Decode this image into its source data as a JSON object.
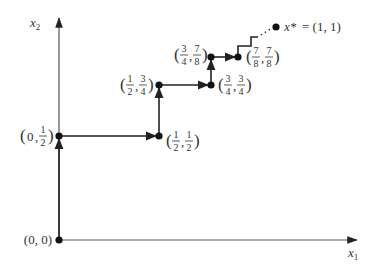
{
  "figure": {
    "axes": {
      "x_label": "x",
      "x_label_sub": "1",
      "y_label": "x",
      "y_label_sub": "2"
    },
    "points": [
      {
        "id": "p0",
        "label_plain": "(0, 0)",
        "x": 0,
        "y": 0
      },
      {
        "id": "p1",
        "label_plain": "(0, 1/2)",
        "x_num": "0",
        "y_num": "1",
        "y_den": "2",
        "x": 0,
        "y": 0.5
      },
      {
        "id": "p2",
        "label_plain": "(1/2, 1/2)",
        "x_num": "1",
        "x_den": "2",
        "y_num": "1",
        "y_den": "2",
        "x": 0.5,
        "y": 0.5
      },
      {
        "id": "p3",
        "label_plain": "(1/2, 3/4)",
        "x_num": "1",
        "x_den": "2",
        "y_num": "3",
        "y_den": "4",
        "x": 0.5,
        "y": 0.75
      },
      {
        "id": "p4",
        "label_plain": "(3/4, 3/4)",
        "x_num": "3",
        "x_den": "4",
        "y_num": "3",
        "y_den": "4",
        "x": 0.75,
        "y": 0.75
      },
      {
        "id": "p5",
        "label_plain": "(3/4, 7/8)",
        "x_num": "3",
        "x_den": "4",
        "y_num": "7",
        "y_den": "8",
        "x": 0.75,
        "y": 0.875
      },
      {
        "id": "p6",
        "label_plain": "(7/8, 7/8)",
        "x_num": "7",
        "x_den": "8",
        "y_num": "7",
        "y_den": "8",
        "x": 0.875,
        "y": 0.875
      }
    ],
    "limit_point": {
      "symbol": "x*",
      "equals": "= (1, 1)",
      "x": 1,
      "y": 1
    },
    "origin_label": "(0, 0)",
    "colors": {
      "line": "#222222",
      "axis": "#555555",
      "text": "#333333"
    }
  }
}
